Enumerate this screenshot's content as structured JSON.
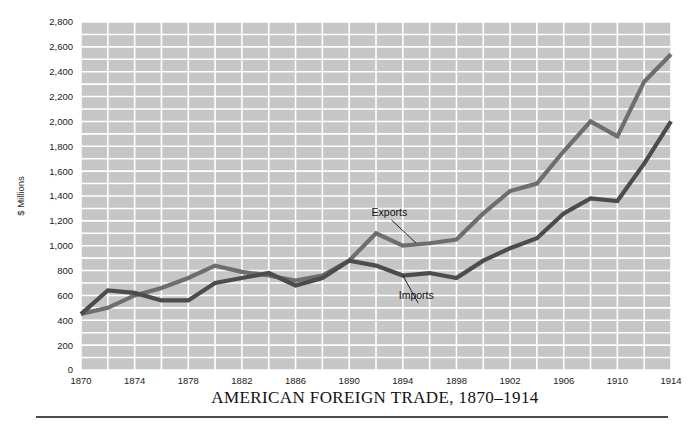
{
  "chart_data": {
    "type": "line",
    "title": "AMERICAN FOREIGN TRADE, 1870–1914",
    "xlabel": "",
    "ylabel": "$ Millions",
    "xlim": [
      1870,
      1914
    ],
    "ylim": [
      0,
      2800
    ],
    "ytick_labels": [
      "0",
      "200",
      "400",
      "600",
      "800",
      "1,000",
      "1,200",
      "1,400",
      "1,600",
      "1,800",
      "2,000",
      "2,200",
      "2,400",
      "2,600",
      "2,800"
    ],
    "ytick_values": [
      0,
      200,
      400,
      600,
      800,
      1000,
      1200,
      1400,
      1600,
      1800,
      2000,
      2200,
      2400,
      2600,
      2800
    ],
    "xtick_labels": [
      "1870",
      "1874",
      "1878",
      "1882",
      "1886",
      "1890",
      "1894",
      "1898",
      "1902",
      "1906",
      "1910",
      "1914"
    ],
    "xtick_values": [
      1870,
      1874,
      1878,
      1882,
      1886,
      1890,
      1894,
      1898,
      1902,
      1906,
      1910,
      1914
    ],
    "grid": true,
    "grid_minor_y_step": 100,
    "grid_minor_x_step": 2,
    "legend_position": "inline-annotations",
    "x": [
      1870,
      1872,
      1874,
      1876,
      1878,
      1880,
      1882,
      1884,
      1886,
      1888,
      1890,
      1892,
      1894,
      1896,
      1898,
      1900,
      1902,
      1904,
      1906,
      1908,
      1910,
      1912,
      1914
    ],
    "series": [
      {
        "name": "Exports",
        "color": "#6e6e6e",
        "values": [
          450,
          500,
          600,
          660,
          740,
          840,
          790,
          760,
          720,
          760,
          880,
          1100,
          1000,
          1020,
          1050,
          1260,
          1440,
          1500,
          1760,
          2000,
          1880,
          2320,
          2540
        ]
      },
      {
        "name": "Imports",
        "color": "#4c4c4c",
        "values": [
          450,
          640,
          620,
          560,
          560,
          700,
          740,
          780,
          680,
          740,
          880,
          840,
          760,
          780,
          740,
          880,
          980,
          1060,
          1260,
          1380,
          1360,
          1660,
          2000
        ]
      }
    ],
    "annotations": [
      {
        "text": "Exports",
        "x": 1893,
        "y": 1240,
        "target_x": 1895,
        "target_y": 1020
      },
      {
        "text": "Imports",
        "x": 1895,
        "y": 570,
        "target_x": 1894,
        "target_y": 760
      }
    ]
  },
  "colors": {
    "plot_background": "#c6c6c6",
    "gridline": "#ffffff",
    "exports_line": "#6e6e6e",
    "imports_line": "#4c4c4c",
    "text": "#111111",
    "rule": "#111111"
  }
}
